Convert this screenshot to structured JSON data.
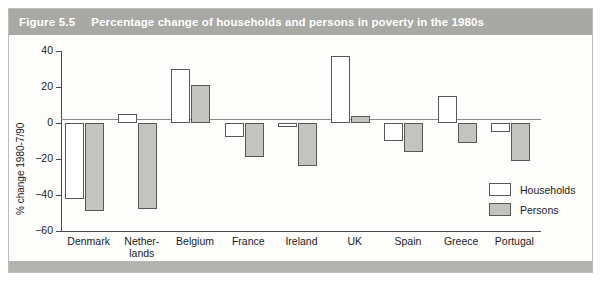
{
  "figure": {
    "number_label": "Figure 5.5",
    "caption": "Percentage change of households and persons in poverty in the 1980s"
  },
  "chart_data": {
    "type": "bar",
    "title": "Percentage change of households and persons in poverty in the 1980s",
    "xlabel": "",
    "ylabel": "% change 1980-7/90",
    "ylim": [
      -60,
      40
    ],
    "yticks": [
      40,
      20,
      0,
      -20,
      -40,
      -60
    ],
    "ytick_labels": [
      "40",
      "20",
      "0",
      "−20",
      "−40",
      "−60"
    ],
    "grid": false,
    "zero_line": true,
    "legend_position": "inside-bottom-right",
    "categories": [
      "Denmark",
      "Netherlands",
      "Belgium",
      "France",
      "Ireland",
      "UK",
      "Spain",
      "Greece",
      "Portugal"
    ],
    "category_labels": [
      "Denmark",
      "Nether-\nlands",
      "Belgium",
      "France",
      "Ireland",
      "UK",
      "Spain",
      "Greece",
      "Portugal"
    ],
    "series": [
      {
        "name": "Households",
        "color": "#ffffff",
        "edge_color": "#585858",
        "values": [
          -42,
          5,
          30,
          -8,
          -2,
          37,
          -10,
          15,
          -5
        ]
      },
      {
        "name": "Persons",
        "color": "#c3c3c0",
        "edge_color": "#585858",
        "values": [
          -49,
          -48,
          21,
          -19,
          -24,
          4,
          -16,
          -11,
          -21
        ]
      }
    ]
  },
  "legend": {
    "items": [
      {
        "label": "Households",
        "swatch": "households"
      },
      {
        "label": "Persons",
        "swatch": "persons"
      }
    ]
  },
  "colors": {
    "title_bar": "#a8a8a4",
    "bottom_strip": "#b3b3af",
    "households_fill": "#ffffff",
    "persons_fill": "#c3c3c0",
    "axis": "#4a4a4a"
  }
}
